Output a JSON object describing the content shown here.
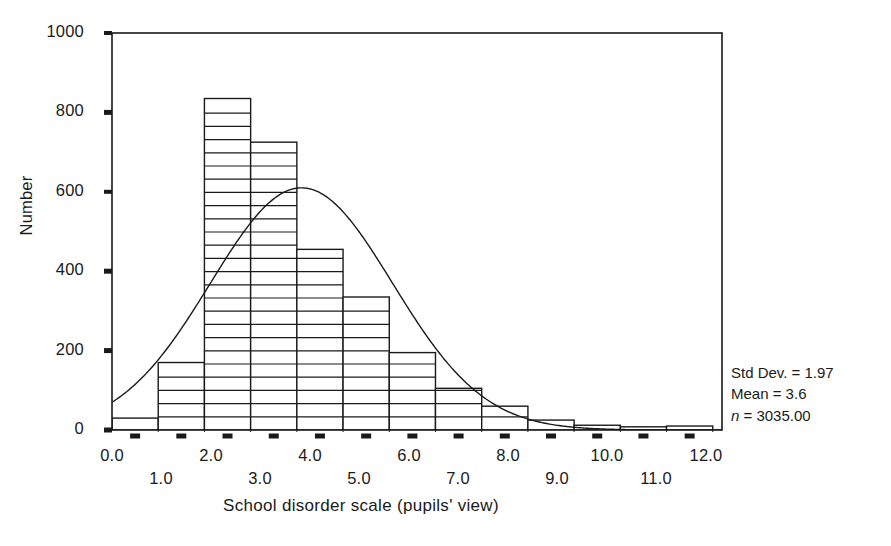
{
  "chart_data": {
    "type": "bar",
    "title": "",
    "xlabel": "School disorder scale (pupils' view)",
    "ylabel": "Number",
    "xlim": [
      -0.5,
      12.7
    ],
    "ylim": [
      0,
      1000
    ],
    "grid": false,
    "bin_width": 1.0,
    "categories": [
      "0.0",
      "1.0",
      "2.0",
      "3.0",
      "4.0",
      "5.0",
      "6.0",
      "7.0",
      "8.0",
      "9.0",
      "10.0",
      "11.0",
      "12.0"
    ],
    "bin_centers": [
      0.0,
      1.0,
      2.0,
      3.0,
      4.0,
      5.0,
      6.0,
      7.0,
      8.0,
      9.0,
      10.0,
      11.0,
      12.0
    ],
    "values": [
      30,
      170,
      835,
      725,
      455,
      335,
      195,
      105,
      60,
      25,
      12,
      8,
      10
    ],
    "series": [
      {
        "name": "Number of pupils",
        "values": [
          30,
          170,
          835,
          725,
          455,
          335,
          195,
          105,
          60,
          25,
          12,
          8,
          10
        ]
      }
    ],
    "overlay": {
      "name": "normal-curve",
      "type": "line",
      "mean": 3.6,
      "std_dev": 1.97,
      "n": 3035,
      "peak_value": 610,
      "peak_x": 3.6,
      "left_edge_value": 70
    },
    "y_ticks": [
      0,
      200,
      400,
      600,
      800,
      1000
    ],
    "y_tick_labels": [
      "0",
      "200",
      "400",
      "600",
      "800",
      "1000"
    ],
    "x_ticks_upper": [
      "0.0",
      "2.0",
      "4.0",
      "6.0",
      "8.0",
      "10.0",
      "12.0"
    ],
    "x_ticks_lower": [
      "1.0",
      "3.0",
      "5.0",
      "7.0",
      "9.0",
      "11.0"
    ],
    "annotations": {
      "std_dev": "Std Dev. = 1.97",
      "mean": "Mean = 3.6",
      "n_prefix": "n",
      "n_rest": " = 3035.00"
    },
    "style": {
      "bar_fill": "#ffffff",
      "bar_stroke": "#1a1a1a",
      "hatch": "horizontal-lines",
      "curve_color": "#1a1a1a",
      "axis_color": "#1a1a1a"
    }
  }
}
